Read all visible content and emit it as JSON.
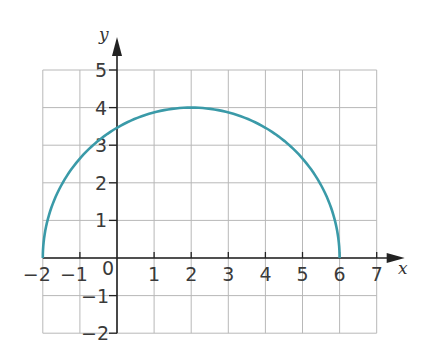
{
  "chart_data": {
    "type": "line",
    "title": "",
    "xlabel": "x",
    "ylabel": "y",
    "xlim": [
      -2,
      7
    ],
    "ylim": [
      -2,
      5
    ],
    "grid": true,
    "x_ticks": [
      "-2",
      "-1",
      "0",
      "1",
      "2",
      "3",
      "4",
      "5",
      "6",
      "7"
    ],
    "y_ticks": [
      "-2",
      "-1",
      "1",
      "2",
      "3",
      "4",
      "5"
    ],
    "origin_label": "0",
    "series": [
      {
        "name": "semicircle",
        "description": "Upper half of circle centered at (2, 0) with radius 4",
        "color": "#3a9aa8",
        "x": [
          -2,
          -1,
          0,
          1,
          2,
          3,
          4,
          5,
          6
        ],
        "y": [
          0,
          2.65,
          3.46,
          3.87,
          4,
          3.87,
          3.46,
          2.65,
          0
        ]
      }
    ]
  },
  "colors": {
    "curve": "#3a9aa8",
    "grid": "#b8b8b8",
    "axis": "#222222"
  }
}
